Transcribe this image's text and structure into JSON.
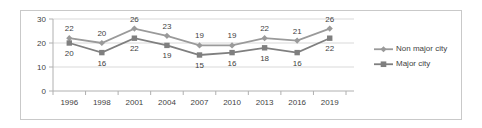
{
  "chart_data": {
    "type": "line",
    "title": "",
    "xlabel": "",
    "ylabel": "",
    "categories": [
      "1996",
      "1998",
      "2001",
      "2004",
      "2007",
      "2010",
      "2013",
      "2016",
      "2019"
    ],
    "series": [
      {
        "name": "Non major city",
        "marker": "diamond",
        "color": "#9a9a9a",
        "values": [
          22,
          20,
          26,
          23,
          19,
          19,
          22,
          21,
          26
        ]
      },
      {
        "name": "Major city",
        "marker": "square",
        "color": "#7f7f7f",
        "values": [
          20,
          16,
          22,
          19,
          15,
          16,
          18,
          16,
          22
        ]
      }
    ],
    "ylim": [
      0,
      30
    ],
    "yticks": [
      0,
      10,
      20,
      30
    ],
    "grid": true,
    "legend_position": "right",
    "data_labels": true
  },
  "axis": {
    "y_tick_labels": [
      "30",
      "20",
      "10",
      "0"
    ],
    "x_tick_labels": [
      "1996",
      "1998",
      "2001",
      "2004",
      "2007",
      "2010",
      "2013",
      "2016",
      "2019"
    ]
  },
  "legend": {
    "entries": [
      {
        "label": "Non major city",
        "marker": "diamond-marker"
      },
      {
        "label": "Major city",
        "marker": "square-marker"
      }
    ]
  },
  "colors": {
    "series_non_major": "#9a9a9a",
    "series_major": "#7f7f7f",
    "grid": "#d9d9d9",
    "axis": "#b0b0b0",
    "text": "#3f3f3f",
    "border": "#c9c9c9"
  }
}
